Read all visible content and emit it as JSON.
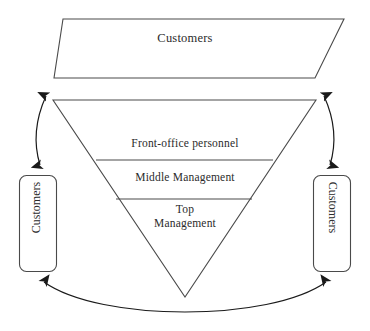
{
  "diagram": {
    "type": "inverted-pyramid-service-organization",
    "background_color": "#ffffff",
    "stroke_color": "#4a4a4a",
    "text_color": "#2b2b2b",
    "shapes": {
      "top_trapezoid": {
        "label": "Customers",
        "shape": "trapezoid",
        "fill": "#ffffff"
      },
      "inverted_triangle": {
        "shape": "inverted-triangle",
        "fill": "#ffffff",
        "tiers": [
          {
            "label": "Front-office personnel"
          },
          {
            "label": "Middle Management"
          },
          {
            "label": "Top Management"
          }
        ]
      },
      "left_box": {
        "label": "Customers",
        "shape": "rounded-rectangle",
        "orientation": "vertical-bottom-to-top",
        "fill": "#ffffff"
      },
      "right_box": {
        "label": "Customers",
        "shape": "rounded-rectangle",
        "orientation": "vertical-top-to-bottom",
        "fill": "#ffffff"
      }
    },
    "connectors": {
      "left_arrow": {
        "style": "double-headed-curved-arrow"
      },
      "right_arrow": {
        "style": "double-headed-curved-arrow"
      },
      "bottom_arc": {
        "style": "double-headed-curved-arrow"
      }
    }
  }
}
